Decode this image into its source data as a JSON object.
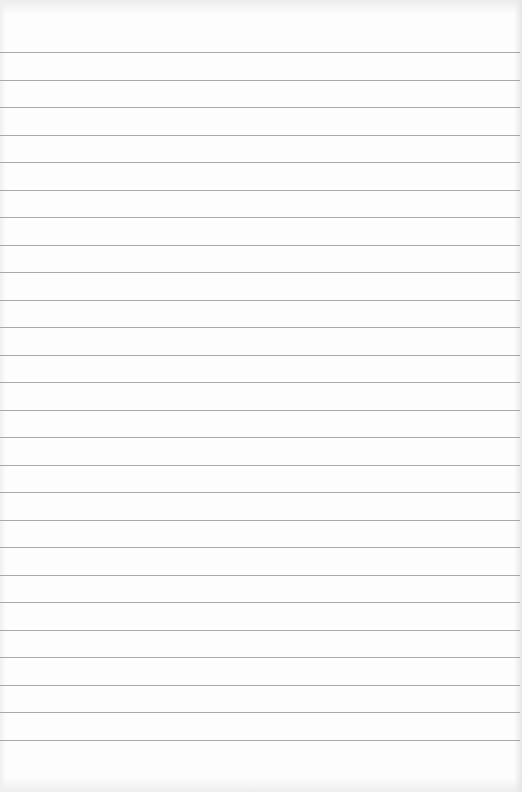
{
  "document": {
    "type": "ruled-paper",
    "text_content": "",
    "paper_color": "#fdfdfd",
    "line_color": "#9a9a9a",
    "line_count": 26,
    "first_line_y": 52,
    "line_spacing": 27.5
  }
}
